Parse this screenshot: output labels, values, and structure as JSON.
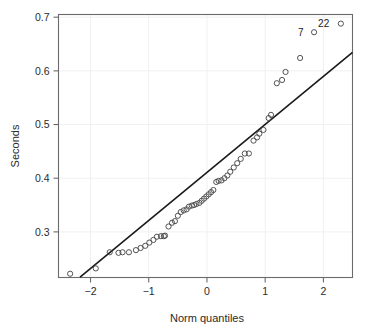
{
  "chart_data": {
    "type": "scatter",
    "title": "",
    "subtitle": "",
    "xlabel": "Norm quantiles",
    "ylabel": "Seconds",
    "xlim": [
      -2.55,
      2.5
    ],
    "ylim": [
      0.215,
      0.705
    ],
    "xticks": [
      -2,
      -1,
      0,
      1,
      2
    ],
    "xtick_labels": [
      "−2",
      "−1",
      "0",
      "1",
      "2"
    ],
    "yticks": [
      0.3,
      0.4,
      0.5,
      0.6,
      0.7
    ],
    "ytick_labels": [
      "0.3",
      "0.4",
      "0.5",
      "0.6",
      "0.7"
    ],
    "grid": "faint",
    "legend": "none",
    "marker": "open-circle",
    "marker_color": "#4a4a4a",
    "line_color": "#1a1a1a",
    "series": [
      {
        "name": "sample quantiles",
        "x": [
          -2.35,
          -1.91,
          -1.67,
          -1.52,
          -1.45,
          -1.34,
          -1.22,
          -1.14,
          -1.06,
          -0.99,
          -0.92,
          -0.86,
          -0.79,
          -0.74,
          -0.72,
          -0.66,
          -0.6,
          -0.55,
          -0.5,
          -0.45,
          -0.4,
          -0.35,
          -0.31,
          -0.26,
          -0.22,
          -0.18,
          -0.13,
          -0.09,
          -0.05,
          -0.01,
          0.03,
          0.07,
          0.11,
          0.16,
          0.2,
          0.25,
          0.3,
          0.35,
          0.4,
          0.46,
          0.52,
          0.58,
          0.65,
          0.72,
          0.8,
          0.86,
          0.9,
          0.97,
          1.06,
          1.1,
          1.2,
          1.29,
          1.35,
          1.6,
          1.84,
          2.3
        ],
        "y": [
          0.222,
          0.232,
          0.262,
          0.261,
          0.262,
          0.262,
          0.266,
          0.27,
          0.274,
          0.28,
          0.285,
          0.291,
          0.292,
          0.292,
          0.293,
          0.31,
          0.317,
          0.32,
          0.33,
          0.337,
          0.34,
          0.342,
          0.347,
          0.349,
          0.35,
          0.352,
          0.354,
          0.358,
          0.362,
          0.366,
          0.37,
          0.374,
          0.378,
          0.393,
          0.395,
          0.396,
          0.4,
          0.405,
          0.412,
          0.42,
          0.428,
          0.436,
          0.446,
          0.446,
          0.47,
          0.476,
          0.483,
          0.49,
          0.512,
          0.518,
          0.577,
          0.583,
          0.598,
          0.624,
          0.672,
          0.688
        ]
      }
    ],
    "reference_line": {
      "name": "qq reference line",
      "x_start": -2.18,
      "y_start": 0.2155,
      "x_end": 2.5,
      "y_end": 0.6345
    },
    "point_labels": [
      {
        "text": "7",
        "x": 1.84,
        "y": 0.672,
        "label_dx": -0.18
      },
      {
        "text": "22",
        "x": 2.3,
        "y": 0.688,
        "label_dx": -0.2
      }
    ]
  }
}
